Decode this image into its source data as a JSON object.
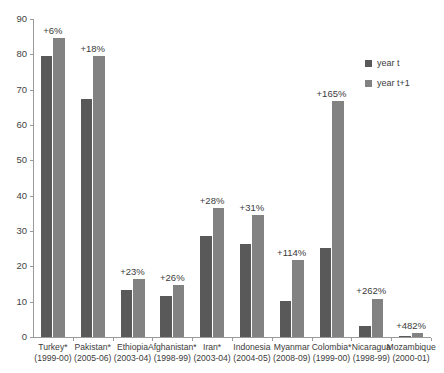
{
  "chart_data": {
    "type": "bar",
    "title": "",
    "xlabel": "",
    "ylabel": "",
    "ylim": [
      0,
      90
    ],
    "yticks": [
      0,
      10,
      20,
      30,
      40,
      50,
      60,
      70,
      80,
      90
    ],
    "grid": false,
    "legend_position": "right",
    "categories": [
      "Turkey*",
      "Pakistan*",
      "Ethiopia",
      "Afghanistan*",
      "Iran*",
      "Indonesia",
      "Myanmar",
      "Colombia*",
      "Nicaragua",
      "Mozambique"
    ],
    "category_periods": [
      "(1999-00)",
      "(2005-06)",
      "(2003-04)",
      "(1998-99)",
      "(2003-04)",
      "(2004-05)",
      "(2008-09)",
      "(1999-00)",
      "(1998-99)",
      "(2000-01)"
    ],
    "series": [
      {
        "name": "year t",
        "color": "#595959",
        "values": [
          79.5,
          67.5,
          13.3,
          11.6,
          28.6,
          26.4,
          10.2,
          25.2,
          3.0,
          0.2
        ]
      },
      {
        "name": "year t+1",
        "color": "#828282",
        "values": [
          84.5,
          79.6,
          16.4,
          14.6,
          36.6,
          34.6,
          21.8,
          66.8,
          10.9,
          1.2
        ]
      }
    ],
    "annotations": [
      "+6%",
      "+18%",
      "+23%",
      "+26%",
      "+28%",
      "+31%",
      "+114%",
      "+165%",
      "+262%",
      "+482%"
    ]
  },
  "legend": {
    "items": [
      {
        "label": "year t"
      },
      {
        "label": "year t+1"
      }
    ]
  },
  "title_remnant": ""
}
